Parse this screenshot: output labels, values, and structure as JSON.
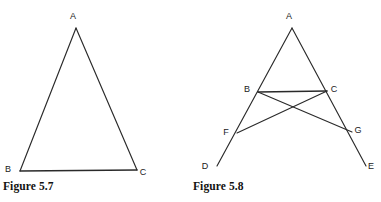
{
  "page": {
    "background_color": "#ffffff",
    "ink_color": "#2a2a2a",
    "label_color": "#1a1a1a",
    "width": 381,
    "height": 202
  },
  "figures": [
    {
      "id": "figure-5-7",
      "caption": "Figure 5.7",
      "shape_type": "triangle",
      "vertices": [
        {
          "label": "A",
          "x": 76,
          "y": 28,
          "label_x": 73,
          "label_y": 17
        },
        {
          "label": "B",
          "x": 20,
          "y": 171,
          "label_x": 8,
          "label_y": 170
        },
        {
          "label": "C",
          "x": 137,
          "y": 170,
          "label_x": 143,
          "label_y": 173
        }
      ],
      "segments": [
        {
          "name": "AB",
          "from": "A",
          "to": "B"
        },
        {
          "name": "AC",
          "from": "A",
          "to": "C"
        },
        {
          "name": "BC",
          "from": "B",
          "to": "C"
        }
      ]
    },
    {
      "id": "figure-5-8",
      "caption": "Figure 5.8",
      "shape_type": "triangle-with-extended-sides-and-crossing-segments",
      "vertices": [
        {
          "label": "A",
          "x": 292,
          "y": 28,
          "label_x": 289,
          "label_y": 17
        },
        {
          "label": "B",
          "x": 258,
          "y": 92,
          "label_x": 247,
          "label_y": 90
        },
        {
          "label": "C",
          "x": 327,
          "y": 91,
          "label_x": 334,
          "label_y": 90
        },
        {
          "label": "F",
          "x": 237,
          "y": 133,
          "label_x": 226,
          "label_y": 133
        },
        {
          "label": "G",
          "x": 352,
          "y": 132,
          "label_x": 358,
          "label_y": 131
        },
        {
          "label": "D",
          "x": 217,
          "y": 166,
          "label_x": 205,
          "label_y": 167
        },
        {
          "label": "E",
          "x": 366,
          "y": 166,
          "label_x": 371,
          "label_y": 167
        }
      ],
      "segments": [
        {
          "name": "AD",
          "from": "A",
          "to": "D",
          "passes_through": [
            "B",
            "F"
          ]
        },
        {
          "name": "AE",
          "from": "A",
          "to": "E",
          "passes_through": [
            "C",
            "G"
          ]
        },
        {
          "name": "BC",
          "from": "B",
          "to": "C"
        },
        {
          "name": "BG",
          "from": "B",
          "to": "G"
        },
        {
          "name": "CF",
          "from": "C",
          "to": "F"
        }
      ]
    }
  ]
}
